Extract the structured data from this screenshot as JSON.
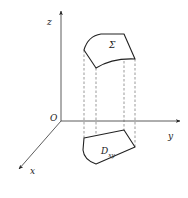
{
  "figure": {
    "type": "3D coordinate diagram: surface projected onto xy-plane",
    "axes": {
      "origin_label": "O",
      "x_label": "x",
      "y_label": "y",
      "z_label": "z"
    },
    "surface": {
      "label": "Σ"
    },
    "projection": {
      "label_main": "D",
      "label_sub": "xy"
    },
    "caption": "",
    "colors": {
      "stroke": "#333333",
      "dashed": "#555555",
      "background": "#ffffff"
    }
  }
}
